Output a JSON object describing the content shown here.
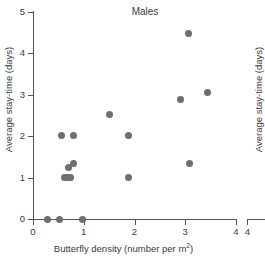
{
  "chart_data": {
    "type": "scatter",
    "title": "Males",
    "xlabel": "Butterfly density (number per m",
    "xlabel_sup": "2",
    "xlabel_tail": ")",
    "xlabel_full": "Butterfly density (number per m2)",
    "ylabel": "Average stay-time (days)",
    "xlim": [
      0,
      4
    ],
    "ylim": [
      0,
      5
    ],
    "xticks": [
      "0",
      "1",
      "2",
      "3",
      "4"
    ],
    "xtick_values": [
      0,
      1,
      2,
      3,
      4
    ],
    "yticks": [
      "0",
      "1",
      "2",
      "3",
      "4",
      "5"
    ],
    "ytick_values": [
      0,
      1,
      2,
      3,
      4,
      5
    ],
    "grid": false,
    "legend": null,
    "marker_color": "#6e6e6e",
    "axis_color": "#555555",
    "text_color": "#3a3a3a",
    "points": [
      {
        "x": 0.28,
        "y": 0.0
      },
      {
        "x": 0.52,
        "y": 0.0
      },
      {
        "x": 0.98,
        "y": 0.0
      },
      {
        "x": 0.62,
        "y": 1.0
      },
      {
        "x": 0.68,
        "y": 1.0
      },
      {
        "x": 0.73,
        "y": 1.0
      },
      {
        "x": 0.7,
        "y": 1.25
      },
      {
        "x": 0.8,
        "y": 1.33
      },
      {
        "x": 0.57,
        "y": 2.02
      },
      {
        "x": 0.79,
        "y": 2.02
      },
      {
        "x": 1.5,
        "y": 2.52
      },
      {
        "x": 1.88,
        "y": 1.01
      },
      {
        "x": 1.88,
        "y": 2.02
      },
      {
        "x": 2.9,
        "y": 2.88
      },
      {
        "x": 3.07,
        "y": 4.47
      },
      {
        "x": 3.09,
        "y": 1.35
      },
      {
        "x": 3.43,
        "y": 3.05
      }
    ]
  },
  "right_panel": {
    "ylabel": "Average stay-time (days)",
    "xtick_label": "4"
  }
}
